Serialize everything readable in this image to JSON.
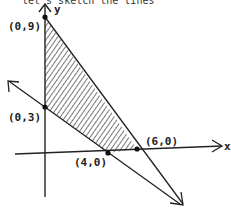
{
  "caption": "let's sketch the lines",
  "axes": {
    "x_label": "x",
    "y_label": "y"
  },
  "points": [
    {
      "label": "(0,9)",
      "x": 0,
      "y": 9
    },
    {
      "label": "(0,3)",
      "x": 0,
      "y": 3
    },
    {
      "label": "(4,0)",
      "x": 4,
      "y": 0
    },
    {
      "label": "(6,0)",
      "x": 6,
      "y": 0
    }
  ],
  "lines": [
    {
      "name": "line-through-0-9-and-6-0",
      "from": "(0,9)",
      "to": "(6,0)"
    },
    {
      "name": "line-through-0-3-and-4-0",
      "from": "(0,3)",
      "to": "(4,0)"
    }
  ],
  "shaded_region": [
    "(0,9)",
    "(0,3)",
    "(4,0)",
    "(6,0)"
  ],
  "colors": {
    "ink": "#222222",
    "shade": "#555555",
    "background": "#ffffff"
  }
}
